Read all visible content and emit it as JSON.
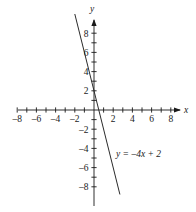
{
  "chart_data": {
    "type": "line",
    "title": "",
    "xlabel": "x",
    "ylabel": "y",
    "equation_label": "y = –4x + 2",
    "slope": -4,
    "intercept": 2,
    "grid": false,
    "legend": "none",
    "xlim": [
      -9,
      9
    ],
    "ylim": [
      -9.5,
      9.5
    ],
    "x_tick_labels": [
      "–8",
      "–6",
      "–4",
      "–2",
      "2",
      "4",
      "6",
      "8"
    ],
    "x_tick_values": [
      -8,
      -6,
      -4,
      -2,
      2,
      4,
      6,
      8
    ],
    "y_tick_labels": [
      "8",
      "6",
      "4",
      "2",
      "–2",
      "–4",
      "–6",
      "–8"
    ],
    "y_tick_values": [
      8,
      6,
      4,
      2,
      -2,
      -4,
      -6,
      -8
    ],
    "x_minor_ticks": [
      -8,
      -7,
      -6,
      -5,
      -4,
      -3,
      -2,
      -1,
      1,
      2,
      3,
      4,
      5,
      6,
      7,
      8
    ],
    "y_minor_ticks": [
      -8,
      -7,
      -6,
      -5,
      -4,
      -3,
      -2,
      -1,
      1,
      2,
      3,
      4,
      5,
      6,
      7,
      8
    ],
    "series": [
      {
        "name": "y = –4x + 2",
        "points": [
          {
            "x": -2.0,
            "y": 10.0
          },
          {
            "x": 2.7,
            "y": -8.8
          }
        ]
      }
    ],
    "colors": {
      "axis": "#1a1a1a",
      "line": "#2b2b2b",
      "background": "#ffffff",
      "text": "#1a1a1a"
    }
  },
  "geometry": {
    "origin_x": 94,
    "origin_y": 110,
    "unit_px": 9.6,
    "x_axis_start_px": 18,
    "x_axis_end_px": 180,
    "y_axis_top_px": 20,
    "y_axis_bottom_px": 206,
    "equation_label_x": 116,
    "equation_label_y": 157,
    "x_name_x": 184,
    "x_name_y": 113,
    "y_name_x": 90,
    "y_name_y": 12
  }
}
